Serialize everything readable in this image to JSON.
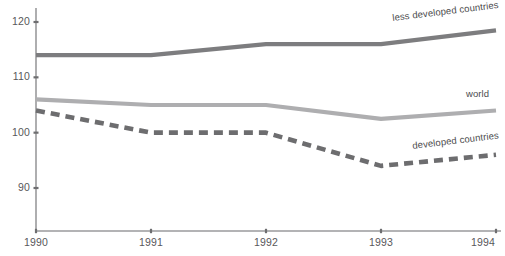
{
  "chart_data": {
    "type": "line",
    "title": "",
    "subtitle": "",
    "xlabel": "",
    "ylabel": "",
    "x": [
      1990,
      1991,
      1992,
      1993,
      1994
    ],
    "xtick_labels": [
      "1990",
      "1991",
      "1992",
      "1993",
      "1994"
    ],
    "ytick_labels": [
      "120",
      "110",
      "100",
      "90"
    ],
    "ytick_values": [
      120,
      110,
      100,
      90
    ],
    "ylim": [
      84.5,
      122
    ],
    "xlim": [
      1990,
      1994
    ],
    "grid": false,
    "legend_position": "inline-right-of-lines",
    "series": [
      {
        "name": "less developed countries",
        "values": [
          114,
          114,
          116,
          116,
          118.5
        ],
        "color": "#7d7d7f",
        "style": "solid",
        "width": 4.2
      },
      {
        "name": "world",
        "values": [
          106,
          105,
          105,
          102.5,
          104
        ],
        "color": "#aeaeb0",
        "style": "solid",
        "width": 4.2
      },
      {
        "name": "developed countries",
        "values": [
          104,
          100,
          100,
          94,
          96
        ],
        "color": "#6d6d6f",
        "style": "dashed",
        "width": 4.6
      }
    ]
  },
  "axes": {
    "axis_color": "#9a9a9c",
    "tick_color": "#6e6e70",
    "label_color": "#58585a"
  },
  "annotations": {
    "less_developed": "less developed countries",
    "world": "world",
    "developed": "developed countries"
  }
}
